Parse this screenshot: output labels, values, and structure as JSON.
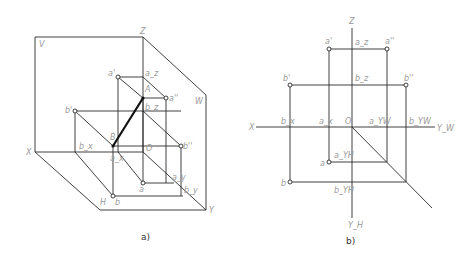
{
  "figure_a": {
    "caption": "a)",
    "labels": {
      "V": "V",
      "Z": "Z",
      "W": "W",
      "X": "X",
      "H": "H",
      "Y": "Y",
      "a_prime": "a'",
      "a_z": "a_z",
      "A": "A",
      "a_dprime": "a''",
      "b_prime": "b'",
      "b_z": "b_z",
      "B": "B",
      "b_x": "b_x",
      "a_x": "a_x",
      "O": "O",
      "b_dprime": "b''",
      "a": "a",
      "a_y": "a_y",
      "b": "b",
      "b_y": "b_y"
    }
  },
  "figure_b": {
    "caption": "b)",
    "labels": {
      "Z": "Z",
      "X": "X",
      "Y_W": "Y_W",
      "Y_H": "Y_H",
      "O": "O",
      "a_prime": "a'",
      "a_z": "a_z",
      "a_dprime": "a''",
      "b_prime": "b'",
      "b_z": "b_z",
      "b_dprime": "b''",
      "b_x": "b_x",
      "a_x": "a_x",
      "a_yw": "a_YW",
      "b_yw": "b_YW",
      "a": "a",
      "a_yh": "a_YH",
      "b": "b",
      "b_yh": "b_YH"
    }
  }
}
